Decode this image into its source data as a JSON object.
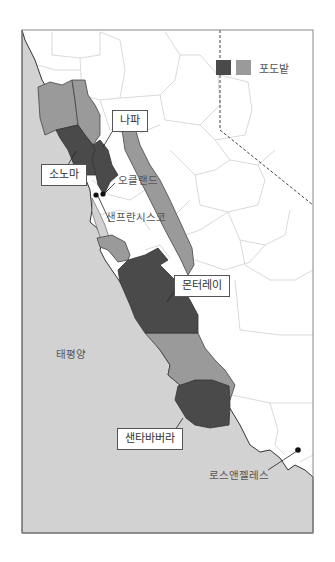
{
  "legend": {
    "label": "포도밭",
    "colors": {
      "dark": "#4a4a4a",
      "light": "#9a9a9a"
    }
  },
  "colors": {
    "ocean": "#d2d2d2",
    "land": "#ffffff",
    "county_lines": "#c8c8c8",
    "frame": "#888888"
  },
  "regions": [
    {
      "name": "나파",
      "shade": "dark"
    },
    {
      "name": "소노마",
      "shade": "dark"
    },
    {
      "name": "몬터레이",
      "shade": "dark"
    },
    {
      "name": "샌타바버라",
      "shade": "dark"
    }
  ],
  "cities": [
    {
      "name": "오클랜드"
    },
    {
      "name": "샌프란시스코"
    },
    {
      "name": "로스앤젤레스"
    }
  ],
  "water": {
    "ocean_label": "태평양"
  }
}
